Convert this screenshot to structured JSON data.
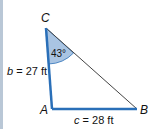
{
  "diagram": {
    "type": "triangle",
    "vertices": {
      "A": {
        "label": "A"
      },
      "B": {
        "label": "B"
      },
      "C": {
        "label": "C"
      }
    },
    "sides": {
      "b": {
        "label_var": "b",
        "label_value": " = 27 ft"
      },
      "c": {
        "label_var": "c",
        "label_value": " = 28 ft"
      }
    },
    "angle_C": {
      "label": "43°"
    },
    "colors": {
      "side_highlight": "#2a6fb8",
      "side_plain": "#444444",
      "angle_fill": "#a9c4e2",
      "left_bar": "#b9c7d6"
    }
  }
}
